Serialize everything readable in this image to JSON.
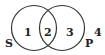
{
  "diagram": {
    "type": "venn",
    "sets": [
      {
        "label": "S"
      },
      {
        "label": "P"
      }
    ],
    "regions": [
      {
        "label": "1"
      },
      {
        "label": "2"
      },
      {
        "label": "3"
      },
      {
        "label": "4"
      }
    ]
  }
}
